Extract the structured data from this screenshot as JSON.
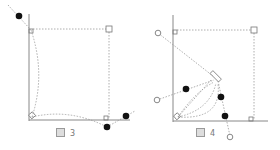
{
  "figures": [
    {
      "id": "fig3",
      "caption_prefix": "図",
      "caption_number": "3"
    },
    {
      "id": "fig4",
      "caption_prefix": "図",
      "caption_number": "4"
    }
  ],
  "colors": {
    "line": "#888888",
    "dot": "#111111",
    "dash": "#999999",
    "open": "#999999"
  }
}
